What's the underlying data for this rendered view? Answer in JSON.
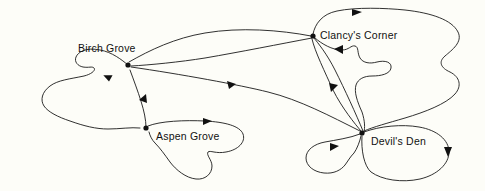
{
  "diagram": {
    "type": "directed-graph",
    "title": "",
    "background_color": "#fdfdf8",
    "edge_color": "#1a1a1a",
    "node_color": "#111111",
    "label_color": "#111111",
    "nodes": [
      {
        "id": "birch-grove",
        "label": "Birch Grove",
        "x": 128,
        "y": 65,
        "label_x": 78,
        "label_y": 42
      },
      {
        "id": "clancys-corner",
        "label": "Clancy's Corner",
        "x": 313,
        "y": 36,
        "label_x": 320,
        "label_y": 29
      },
      {
        "id": "aspen-grove",
        "label": "Aspen Grove",
        "x": 146,
        "y": 128,
        "label_x": 156,
        "label_y": 130
      },
      {
        "id": "devils-den",
        "label": "Devil's Den",
        "x": 362,
        "y": 133,
        "label_x": 371,
        "label_y": 135
      }
    ],
    "edges": [
      {
        "id": "birch-self",
        "from": "birch-grove",
        "to": "birch-grove",
        "kind": "self-loop"
      },
      {
        "id": "birch-to-clancy",
        "from": "birch-grove",
        "to": "clancys-corner",
        "kind": "arc"
      },
      {
        "id": "clancy-to-birch",
        "from": "clancys-corner",
        "to": "birch-grove",
        "kind": "arc"
      },
      {
        "id": "devils-to-birch",
        "from": "devils-den",
        "to": "birch-grove",
        "kind": "arc"
      },
      {
        "id": "aspen-to-birch",
        "from": "aspen-grove",
        "to": "birch-grove",
        "kind": "arc"
      },
      {
        "id": "aspen-self",
        "from": "aspen-grove",
        "to": "aspen-grove",
        "kind": "self-loop"
      },
      {
        "id": "clancy-self-outer",
        "from": "clancys-corner",
        "to": "clancys-corner",
        "kind": "self-loop"
      },
      {
        "id": "clancy-self-inner",
        "from": "clancys-corner",
        "to": "clancys-corner",
        "kind": "self-loop"
      },
      {
        "id": "clancy-to-devils",
        "from": "clancys-corner",
        "to": "devils-den",
        "kind": "arc"
      },
      {
        "id": "devils-to-clancy",
        "from": "devils-den",
        "to": "clancys-corner",
        "kind": "arc"
      },
      {
        "id": "devils-self-left",
        "from": "devils-den",
        "to": "devils-den",
        "kind": "self-loop"
      },
      {
        "id": "devils-self-right",
        "from": "devils-den",
        "to": "devils-den",
        "kind": "self-loop"
      }
    ],
    "node_count": 4,
    "edge_count": 12
  }
}
